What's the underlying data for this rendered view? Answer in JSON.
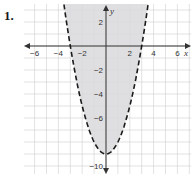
{
  "problem": {
    "number": "1."
  },
  "chart_data": {
    "type": "line",
    "title": "",
    "xlabel": "x",
    "ylabel": "y",
    "xlim": [
      -7,
      7
    ],
    "ylim": [
      -10,
      3
    ],
    "grid": true,
    "x_ticks": [
      -6,
      -4,
      -2,
      2,
      4,
      6
    ],
    "x_tick_labels": [
      "−6",
      "−4",
      "−2",
      "2",
      "4",
      "6"
    ],
    "y_ticks": [
      2,
      -2,
      -4,
      -6,
      -10
    ],
    "y_tick_labels": [
      "2",
      "−2",
      "−4",
      "−6",
      "−10"
    ],
    "series": [
      {
        "name": "y > x^2 - 9",
        "curve": "parabola",
        "equation": "y = x^2 - 9",
        "vertex": [
          0,
          -9
        ],
        "x_intercepts": [
          -3,
          3
        ],
        "line_style": "dashed",
        "shaded_region": "inside (above curve)",
        "points": [
          [
            -3.5,
            3.25
          ],
          [
            -3,
            0
          ],
          [
            -2,
            -5
          ],
          [
            -1,
            -8
          ],
          [
            0,
            -9
          ],
          [
            1,
            -8
          ],
          [
            2,
            -5
          ],
          [
            3,
            0
          ],
          [
            3.5,
            3.25
          ]
        ]
      }
    ],
    "colors": {
      "shade": "#d9d9dc",
      "curve": "#1a1a1a",
      "grid": "#cfcfcf",
      "axis": "#333333"
    }
  }
}
